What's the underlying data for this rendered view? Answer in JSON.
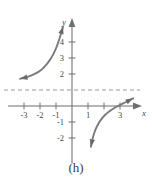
{
  "figure": {
    "caption": "(h)",
    "width": 152,
    "height": 187,
    "background_color": "#ffffff"
  },
  "chart_data": {
    "type": "line",
    "title": "",
    "subtitle": "",
    "xlabel": "x",
    "ylabel": "y",
    "xlim": [
      -4.5,
      5.0
    ],
    "ylim": [
      -3.2,
      5.6
    ],
    "grid": false,
    "legend": null,
    "axis_color": "#6f6f6f",
    "curve_color": "#7a7a7a",
    "asymptote_color": "#9a9a9a",
    "x_ticks": [
      -3,
      -2,
      -1,
      1,
      3
    ],
    "x_tick_labels": [
      "-3",
      "-2",
      "-1",
      "1",
      "3"
    ],
    "x_ticks_unlabeled": [
      2
    ],
    "y_ticks": [
      4,
      3,
      2,
      -1,
      -2
    ],
    "y_tick_labels": [
      "4",
      "3",
      "2",
      "-1",
      "-2"
    ],
    "annotations": [
      {
        "name": "horizontal-asymptote",
        "type": "dashed-horizontal-line",
        "y": 1,
        "style": "dashed",
        "spans": "full-width"
      }
    ],
    "series": [
      {
        "name": "upper-left-branch",
        "arrow_start": true,
        "arrow_end": true,
        "points": [
          [
            -3.25,
            1.7
          ],
          [
            -3.0,
            1.76
          ],
          [
            -2.7,
            1.85
          ],
          [
            -2.4,
            1.97
          ],
          [
            -2.1,
            2.13
          ],
          [
            -1.85,
            2.32
          ],
          [
            -1.6,
            2.58
          ],
          [
            -1.4,
            2.85
          ],
          [
            -1.2,
            3.18
          ],
          [
            -1.02,
            3.55
          ],
          [
            -0.88,
            3.92
          ],
          [
            -0.76,
            4.28
          ],
          [
            -0.66,
            4.62
          ],
          [
            -0.56,
            4.96
          ]
        ]
      },
      {
        "name": "lower-right-branch",
        "arrow_start": true,
        "arrow_end": true,
        "points": [
          [
            1.18,
            -2.55
          ],
          [
            1.26,
            -2.15
          ],
          [
            1.36,
            -1.78
          ],
          [
            1.48,
            -1.44
          ],
          [
            1.64,
            -1.12
          ],
          [
            1.84,
            -0.82
          ],
          [
            2.08,
            -0.55
          ],
          [
            2.34,
            -0.33
          ],
          [
            2.62,
            -0.14
          ],
          [
            2.92,
            0.02
          ],
          [
            3.22,
            0.18
          ],
          [
            3.52,
            0.32
          ],
          [
            3.82,
            0.48
          ]
        ]
      }
    ]
  }
}
